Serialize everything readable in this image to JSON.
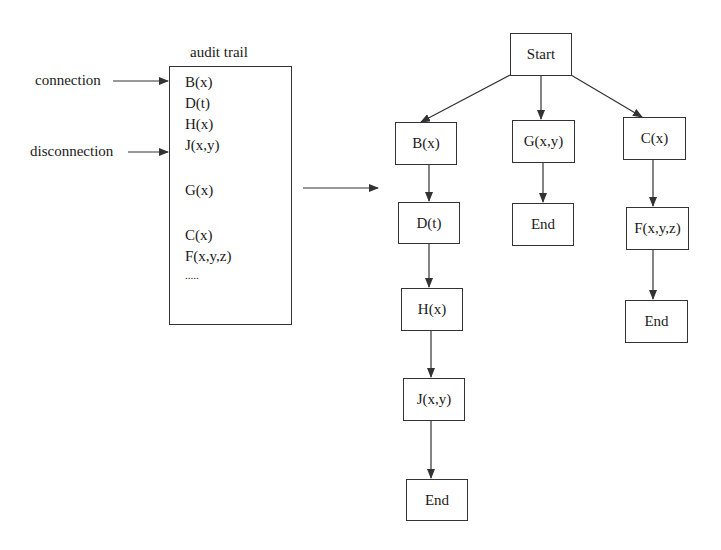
{
  "audit_trail": {
    "title": "audit trail",
    "inputs": [
      {
        "label": "connection",
        "target": "B(x)"
      },
      {
        "label": "disconnection",
        "target": "J(x,y)"
      }
    ],
    "entries": [
      "B(x)",
      "D(t)",
      "H(x)",
      "J(x,y)",
      "G(x)",
      "C(x)",
      "F(x,y,z)",
      "....."
    ]
  },
  "tree": {
    "root": "Start",
    "branches": [
      {
        "nodes": [
          "B(x)",
          "D(t)",
          "H(x)",
          "J(x,y)",
          "End"
        ]
      },
      {
        "nodes": [
          "G(x,y)",
          "End"
        ]
      },
      {
        "nodes": [
          "C(x)",
          "F(x,y,z)",
          "End"
        ]
      }
    ]
  },
  "colors": {
    "line": "#333333",
    "text": "#1a1a1a",
    "background": "#ffffff"
  }
}
